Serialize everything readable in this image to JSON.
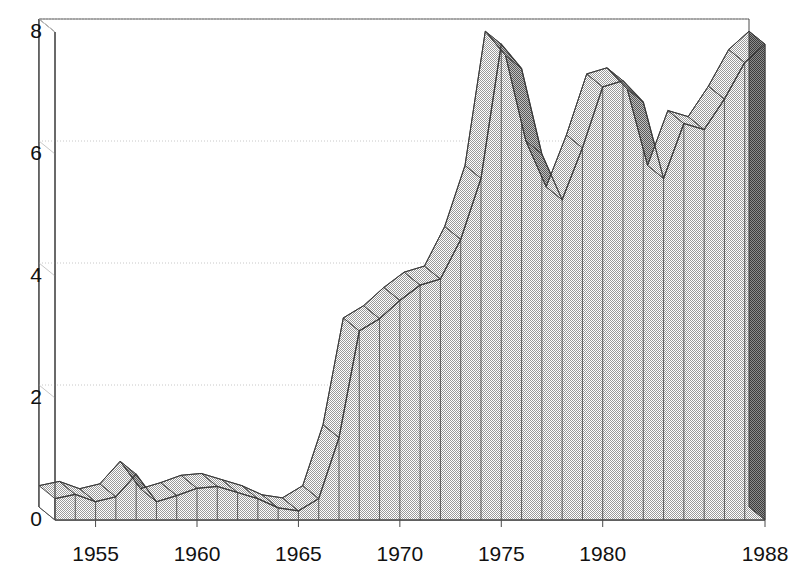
{
  "chart_data": {
    "type": "area",
    "title": "",
    "subtitle": "",
    "xlabel": "",
    "ylabel": "",
    "grid": true,
    "legend": false,
    "legend_position": "none",
    "style": "3d-perspective-area",
    "xlim": [
      1953,
      1988
    ],
    "ylim": [
      0,
      8
    ],
    "yticks": [
      0,
      2,
      4,
      6,
      8
    ],
    "ytick_labels": [
      "0",
      "2",
      "4",
      "6",
      "8"
    ],
    "xticks": [
      1955,
      1960,
      1965,
      1970,
      1975,
      1980,
      1988
    ],
    "xtick_labels": [
      "1955",
      "1960",
      "1965",
      "1970",
      "1975",
      "1980",
      "1988"
    ],
    "x": [
      1953,
      1954,
      1955,
      1956,
      1957,
      1958,
      1959,
      1960,
      1961,
      1962,
      1963,
      1964,
      1965,
      1966,
      1967,
      1968,
      1969,
      1970,
      1971,
      1972,
      1973,
      1974,
      1975,
      1976,
      1977,
      1978,
      1979,
      1980,
      1981,
      1982,
      1983,
      1984,
      1985,
      1986,
      1987,
      1988
    ],
    "values": [
      0.35,
      0.42,
      0.3,
      0.38,
      0.75,
      0.3,
      0.4,
      0.52,
      0.55,
      0.45,
      0.35,
      0.2,
      0.15,
      0.35,
      1.35,
      3.1,
      3.3,
      3.6,
      3.85,
      3.95,
      4.6,
      5.6,
      7.8,
      7.4,
      6.0,
      5.25,
      6.1,
      7.1,
      7.2,
      6.85,
      5.6,
      6.5,
      6.4,
      6.9,
      7.5,
      7.8
    ],
    "colors": {
      "area_fill": "#d4d4d4",
      "area_top_ribbon": "#9c9c9c",
      "side_face": "#6e6e6e",
      "outline": "#3a3a3a",
      "gridline": "#c8c8c8",
      "axis": "#4a4a4a",
      "text": "#111111",
      "background": "#ffffff"
    }
  },
  "axes": {
    "y_labels": [
      "8",
      "6",
      "4",
      "2",
      "0"
    ],
    "x_labels": [
      "1955",
      "1960",
      "1965",
      "1970",
      "1975",
      "1980",
      "1988"
    ]
  }
}
